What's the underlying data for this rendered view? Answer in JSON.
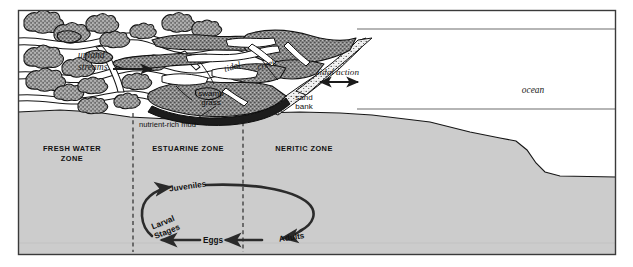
{
  "figure": {
    "canvas": {
      "width": 633,
      "height": 267
    },
    "colors": {
      "background": "#ffffff",
      "water_zone_fill": "#cccccc",
      "marsh_fill": "#8a8a8a",
      "tree_fill": "#9a9a9a",
      "sand_fill": "#e8e8e8",
      "outline": "#111111",
      "frame": "#3a3a3a",
      "ocean_fill": "#ffffff"
    }
  },
  "labels": {
    "upland_streams": "upland\nstreams",
    "upland_streams_line1": "upland",
    "upland_streams_line2": "streams",
    "tidal_creek_word1": "tidal",
    "tidal_creek_word2": "creek",
    "swamp_grass_line1": "swamp",
    "swamp_grass_line2": "grass",
    "sand_bank_line1": "sand",
    "sand_bank_line2": "bank",
    "tidal_action": "tidal action",
    "ocean": "ocean",
    "nutrient_rich_mud": "nutrient-rich mud"
  },
  "zones": [
    {
      "id": "fresh-water-zone",
      "line1": "FRESH WATER",
      "line2": "ZONE",
      "center_x": 72
    },
    {
      "id": "estuarine-zone",
      "line1": "ESTUARINE ZONE",
      "line2": "",
      "center_x": 188
    },
    {
      "id": "neritic-zone",
      "line1": "NERITIC ZONE",
      "line2": "",
      "center_x": 304
    }
  ],
  "dividers": [
    {
      "id": "divider-fresh-estuarine",
      "x": 133
    },
    {
      "id": "divider-estuarine-neritic",
      "x": 243
    }
  ],
  "life_cycle": {
    "caption": "Migratory life cycle of estuarine-dependent species",
    "direction": "counterclockwise",
    "stages": [
      {
        "id": "juveniles",
        "label": "Juveniles"
      },
      {
        "id": "larval-stages",
        "label_line1": "Larval",
        "label_line2": "Stages"
      },
      {
        "id": "eggs",
        "label": "Eggs"
      },
      {
        "id": "adults",
        "label": "Adults"
      }
    ]
  }
}
